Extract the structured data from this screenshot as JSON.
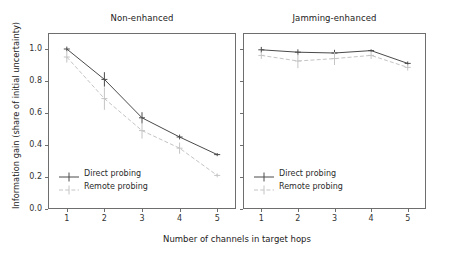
{
  "figure": {
    "xlabel": "Number of channels in target hops",
    "ylabel": "Information gain (share of initial uncertainty)"
  },
  "chart_data": {
    "type": "line",
    "title": "",
    "xlabel": "Number of channels in target hops",
    "ylabel": "Information gain (share of initial uncertainty)",
    "x": [
      1,
      2,
      3,
      4,
      5
    ],
    "xlim": [
      0.5,
      5.5
    ],
    "ylim": [
      0.0,
      1.1
    ],
    "xticks": [
      "1",
      "2",
      "3",
      "4",
      "5"
    ],
    "yticks": [
      "0.0",
      "0.2",
      "0.4",
      "0.6",
      "0.8",
      "1.0"
    ],
    "ytick_values": [
      0.0,
      0.2,
      0.4,
      0.6,
      0.8,
      1.0
    ],
    "grid": false,
    "legend_position": "lower left",
    "panels": [
      {
        "title": "Non-enhanced",
        "series": [
          {
            "name": "Direct probing",
            "style": "solid",
            "color": "#4a4a4a",
            "values": [
              1.0,
              0.81,
              0.57,
              0.45,
              0.34
            ],
            "yerr": [
              0.015,
              0.045,
              0.035,
              0.015,
              0.01
            ]
          },
          {
            "name": "Remote probing",
            "style": "dashed",
            "color": "#c4c4c4",
            "values": [
              0.95,
              0.69,
              0.49,
              0.38,
              0.21
            ],
            "yerr": [
              0.035,
              0.07,
              0.05,
              0.035,
              0.012
            ]
          }
        ]
      },
      {
        "title": "Jamming-enhanced",
        "series": [
          {
            "name": "Direct probing",
            "style": "solid",
            "color": "#4a4a4a",
            "values": [
              0.995,
              0.98,
              0.975,
              0.99,
              0.91
            ],
            "yerr": [
              0.018,
              0.018,
              0.02,
              0.008,
              0.012
            ]
          },
          {
            "name": "Remote probing",
            "style": "dashed",
            "color": "#c4c4c4",
            "values": [
              0.96,
              0.925,
              0.94,
              0.96,
              0.885
            ],
            "yerr": [
              0.022,
              0.045,
              0.04,
              0.022,
              0.02
            ]
          }
        ]
      }
    ],
    "legend": [
      {
        "label": "Direct probing",
        "style": "solid",
        "color": "#4a4a4a"
      },
      {
        "label": "Remote probing",
        "style": "dashed",
        "color": "#c4c4c4"
      }
    ]
  }
}
